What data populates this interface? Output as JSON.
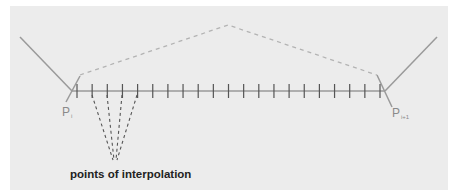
{
  "diagram": {
    "caption": "points of interpolation",
    "labels": {
      "left_point": "P",
      "left_point_sub": "i",
      "right_point": "P",
      "right_point_sub": "i+1"
    },
    "colors": {
      "background": "#ececec",
      "line": "#9a9a9a",
      "dashed_top": "#b3b3b3",
      "ticks": "#555555",
      "converging_dashes": "#555555",
      "caption": "#222222"
    },
    "tick_count": 21
  }
}
